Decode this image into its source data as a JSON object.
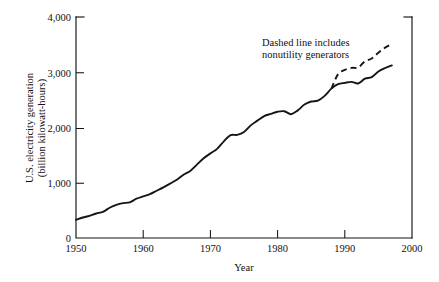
{
  "chart_data": {
    "type": "line",
    "title": "",
    "xlabel": "Year",
    "ylabel": "U.S. electricity generation (billion kilowatt-hours)",
    "ylabel_line1": "U.S. electricity generation",
    "ylabel_line2": "(billion kilowatt-hours)",
    "xlim": [
      1950,
      2000
    ],
    "ylim": [
      0,
      4000
    ],
    "xticks": [
      1950,
      1960,
      1970,
      1980,
      1990,
      2000
    ],
    "xtick_labels": [
      "1950",
      "1960",
      "1970",
      "1980",
      "1990",
      "2000"
    ],
    "yticks": [
      0,
      1000,
      2000,
      3000,
      4000
    ],
    "ytick_labels": [
      "0",
      "1,000",
      "2,000",
      "3,000",
      "4,000"
    ],
    "grid": false,
    "legend_position": "none",
    "annotations": [
      {
        "name": "dashed-line-note",
        "line1": "Dashed line includes",
        "line2": "nonutility generators",
        "x": 1985.5,
        "y": 3650
      }
    ],
    "series": [
      {
        "name": "Electric utility generation",
        "style": "solid",
        "x": [
          1950,
          1951,
          1952,
          1953,
          1954,
          1955,
          1956,
          1957,
          1958,
          1959,
          1960,
          1961,
          1962,
          1963,
          1964,
          1965,
          1966,
          1967,
          1968,
          1969,
          1970,
          1971,
          1972,
          1973,
          1974,
          1975,
          1976,
          1977,
          1978,
          1979,
          1980,
          1981,
          1982,
          1983,
          1984,
          1985,
          1986,
          1987,
          1988,
          1989,
          1990,
          1991,
          1992,
          1993,
          1994,
          1995,
          1996,
          1997
        ],
        "values": [
          330,
          371,
          399,
          443,
          472,
          547,
          601,
          632,
          645,
          711,
          753,
          794,
          855,
          917,
          984,
          1055,
          1144,
          1214,
          1329,
          1442,
          1532,
          1613,
          1750,
          1861,
          1867,
          1918,
          2038,
          2124,
          2206,
          2247,
          2286,
          2295,
          2241,
          2310,
          2416,
          2470,
          2487,
          2572,
          2704,
          2784,
          2808,
          2825,
          2797,
          2883,
          2911,
          3013,
          3077,
          3123
        ]
      },
      {
        "name": "Including nonutility generators",
        "style": "dashed",
        "x": [
          1988,
          1989,
          1990,
          1991,
          1992,
          1993,
          1994,
          1995,
          1996,
          1997
        ],
        "values": [
          2704,
          2965,
          3041,
          3079,
          3087,
          3198,
          3248,
          3353,
          3445,
          3510
        ]
      }
    ]
  },
  "figure": {
    "background_color": "#ffffff",
    "line_color": "#151515",
    "text_color": "#111111"
  }
}
